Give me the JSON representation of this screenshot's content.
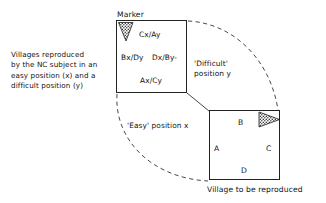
{
  "figure": {
    "caption_left": "Villages reproduced\nby the NC subject in an\neasy position (x) and a\ndifficult position (y)",
    "marker": {
      "title": "Marker",
      "icon_name": "stippled-triangle-down-marker",
      "cells": [
        {
          "id": "cx-ay",
          "label": "Cx/Ay"
        },
        {
          "id": "bx-dy",
          "label": "Bx/Dy"
        },
        {
          "id": "dx-by",
          "label": "Dx/By-"
        },
        {
          "id": "ax-cy",
          "label": "Ax/Cy"
        }
      ]
    },
    "village": {
      "caption": "Village to be reproduced",
      "icon_name": "stippled-triangle-right-marker",
      "corners": [
        {
          "id": "a",
          "label": "A"
        },
        {
          "id": "b",
          "label": "B"
        },
        {
          "id": "c",
          "label": "C"
        },
        {
          "id": "d",
          "label": "D"
        }
      ]
    },
    "paths": [
      {
        "id": "difficult",
        "label": "'Difficult'\nposition y"
      },
      {
        "id": "easy",
        "label": "'Easy' position x"
      }
    ],
    "colors": {
      "stroke": "#222222",
      "text": "#111111",
      "background": "#ffffff",
      "stipple": "#3a3a3a"
    }
  }
}
